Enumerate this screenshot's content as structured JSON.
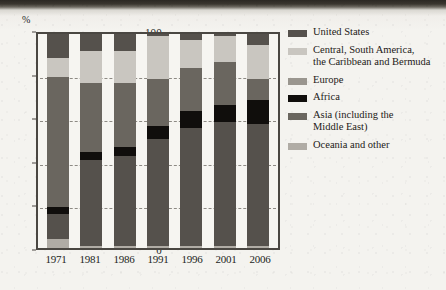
{
  "axis": {
    "y_unit_label": "%",
    "y_ticks": [
      0,
      20,
      40,
      60,
      80,
      100
    ],
    "x_ticks": [
      "1971",
      "1981",
      "1986",
      "1991",
      "1996",
      "2001",
      "2006"
    ]
  },
  "legend": {
    "items": [
      {
        "label": "United States",
        "color": "#55514c",
        "swatch_name": "legend-swatch-united-states"
      },
      {
        "label": "Central, South America,\nthe Caribbean and Bermuda",
        "color": "#c9c6c0",
        "swatch_name": "legend-swatch-central-south-america"
      },
      {
        "label": "Europe",
        "color": "#9a968f",
        "swatch_name": "legend-swatch-europe"
      },
      {
        "label": "Africa",
        "color": "#100e0c",
        "swatch_name": "legend-swatch-africa"
      },
      {
        "label": "Asia (including the\nMiddle East)",
        "color": "#6a665f",
        "swatch_name": "legend-swatch-asia"
      },
      {
        "label": "Oceania and other",
        "color": "#b0aca5",
        "swatch_name": "legend-swatch-oceania"
      }
    ]
  },
  "chart_data": {
    "type": "bar",
    "subtype": "stacked-100-percent",
    "title": "",
    "xlabel": "",
    "ylabel": "%",
    "ylim": [
      0,
      100
    ],
    "grid": true,
    "legend_position": "right",
    "categories": [
      "1971",
      "1981",
      "1986",
      "1991",
      "1996",
      "2001",
      "2006"
    ],
    "series": [
      {
        "name": "Oceania and other",
        "color": "#b0aca5",
        "values": [
          4,
          1,
          1,
          1,
          1,
          1,
          1
        ]
      },
      {
        "name": "United States",
        "color": "#55514c",
        "values": [
          12,
          40,
          42,
          50,
          55,
          58,
          57
        ]
      },
      {
        "name": "Africa",
        "color": "#100e0c",
        "values": [
          3,
          4,
          4,
          6,
          8,
          8,
          11
        ]
      },
      {
        "name": "Asia (including the Middle East)",
        "color": "#6a665f",
        "values": [
          61,
          32,
          30,
          22,
          20,
          20,
          10
        ]
      },
      {
        "name": "Central, South America, the Caribbean and Bermuda",
        "color": "#c9c6c0",
        "values": [
          9,
          15,
          15,
          20,
          13,
          12,
          16
        ]
      },
      {
        "name": "Europe",
        "color": "#9a968f",
        "values": [
          11,
          8,
          8,
          1,
          3,
          1,
          5
        ]
      }
    ],
    "stack_order_bottom_to_top": [
      "Oceania and other",
      "United States",
      "Africa",
      "Asia (including the Middle East)",
      "Central, South America, the Caribbean and Bermuda",
      "Europe"
    ],
    "bars": [
      {
        "year": "1971",
        "segments": [
          {
            "name": "Oceania and other",
            "value": 4,
            "color": "#b0aca5"
          },
          {
            "name": "United States",
            "value": 12,
            "color": "#55514c"
          },
          {
            "name": "Africa",
            "value": 3,
            "color": "#100e0c"
          },
          {
            "name": "Asia (including the Middle East)",
            "value": 61,
            "color": "#6a665f"
          },
          {
            "name": "Central, South America, the Caribbean and Bermuda",
            "value": 9,
            "color": "#c9c6c0"
          },
          {
            "name": "Europe",
            "value": 11,
            "color": "#55514c"
          }
        ]
      },
      {
        "year": "1981",
        "segments": [
          {
            "name": "Oceania and other",
            "value": 1,
            "color": "#b0aca5"
          },
          {
            "name": "United States",
            "value": 40,
            "color": "#55514c"
          },
          {
            "name": "Africa",
            "value": 4,
            "color": "#100e0c"
          },
          {
            "name": "Asia (including the Middle East)",
            "value": 32,
            "color": "#6a665f"
          },
          {
            "name": "Central, South America, the Caribbean and Bermuda",
            "value": 15,
            "color": "#c9c6c0"
          },
          {
            "name": "Europe",
            "value": 8,
            "color": "#55514c"
          }
        ]
      },
      {
        "year": "1986",
        "segments": [
          {
            "name": "Oceania and other",
            "value": 1,
            "color": "#b0aca5"
          },
          {
            "name": "United States",
            "value": 42,
            "color": "#55514c"
          },
          {
            "name": "Africa",
            "value": 4,
            "color": "#100e0c"
          },
          {
            "name": "Asia (including the Middle East)",
            "value": 30,
            "color": "#6a665f"
          },
          {
            "name": "Central, South America, the Caribbean and Bermuda",
            "value": 15,
            "color": "#c9c6c0"
          },
          {
            "name": "Europe",
            "value": 8,
            "color": "#55514c"
          }
        ]
      },
      {
        "year": "1991",
        "segments": [
          {
            "name": "Oceania and other",
            "value": 1,
            "color": "#b0aca5"
          },
          {
            "name": "United States",
            "value": 50,
            "color": "#55514c"
          },
          {
            "name": "Africa",
            "value": 6,
            "color": "#100e0c"
          },
          {
            "name": "Asia (including the Middle East)",
            "value": 22,
            "color": "#6a665f"
          },
          {
            "name": "Central, South America, the Caribbean and Bermuda",
            "value": 20,
            "color": "#c9c6c0"
          },
          {
            "name": "Europe",
            "value": 1,
            "color": "#55514c"
          }
        ]
      },
      {
        "year": "1996",
        "segments": [
          {
            "name": "Oceania and other",
            "value": 1,
            "color": "#b0aca5"
          },
          {
            "name": "United States",
            "value": 55,
            "color": "#55514c"
          },
          {
            "name": "Africa",
            "value": 8,
            "color": "#100e0c"
          },
          {
            "name": "Asia (including the Middle East)",
            "value": 20,
            "color": "#6a665f"
          },
          {
            "name": "Central, South America, the Caribbean and Bermuda",
            "value": 13,
            "color": "#c9c6c0"
          },
          {
            "name": "Europe",
            "value": 3,
            "color": "#55514c"
          }
        ]
      },
      {
        "year": "2001",
        "segments": [
          {
            "name": "Oceania and other",
            "value": 1,
            "color": "#b0aca5"
          },
          {
            "name": "United States",
            "value": 58,
            "color": "#55514c"
          },
          {
            "name": "Africa",
            "value": 8,
            "color": "#100e0c"
          },
          {
            "name": "Asia (including the Middle East)",
            "value": 20,
            "color": "#6a665f"
          },
          {
            "name": "Central, South America, the Caribbean and Bermuda",
            "value": 12,
            "color": "#c9c6c0"
          },
          {
            "name": "Europe",
            "value": 1,
            "color": "#55514c"
          }
        ]
      },
      {
        "year": "2006",
        "segments": [
          {
            "name": "Oceania and other",
            "value": 1,
            "color": "#b0aca5"
          },
          {
            "name": "United States",
            "value": 57,
            "color": "#55514c"
          },
          {
            "name": "Africa",
            "value": 11,
            "color": "#100e0c"
          },
          {
            "name": "Asia (including the Middle East)",
            "value": 10,
            "color": "#6a665f"
          },
          {
            "name": "Central, South America, the Caribbean and Bermuda",
            "value": 16,
            "color": "#c9c6c0"
          },
          {
            "name": "Europe",
            "value": 5,
            "color": "#55514c"
          }
        ]
      }
    ]
  }
}
